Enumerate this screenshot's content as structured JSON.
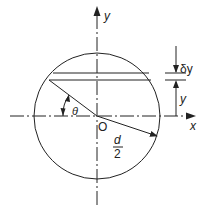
{
  "diagram": {
    "labels": {
      "y_axis": "y",
      "x_axis": "x",
      "origin": "O",
      "theta": "θ",
      "delta_y": "δy",
      "y_dim": "y",
      "radius_num": "d",
      "radius_den": "2"
    },
    "colors": {
      "stroke": "#222222",
      "background": "#ffffff"
    }
  }
}
